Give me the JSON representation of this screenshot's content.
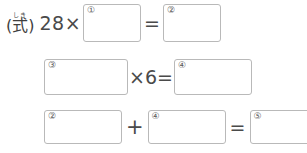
{
  "page": {
    "language": "ja",
    "background_color": "#ffffff",
    "text_color": "#3a3a3a",
    "box_border_color": "#b9b9b9"
  },
  "label": {
    "furigana": "しき",
    "text": "(式)"
  },
  "rows": [
    {
      "id": "row-1",
      "tokens": [
        {
          "kind": "label",
          "value": "(式)"
        },
        {
          "kind": "expr",
          "value": "28×"
        },
        {
          "kind": "box",
          "number": "①"
        },
        {
          "kind": "op",
          "value": "="
        },
        {
          "kind": "box",
          "number": "②"
        }
      ]
    },
    {
      "id": "row-2",
      "tokens": [
        {
          "kind": "box",
          "number": "③"
        },
        {
          "kind": "op",
          "value": "×6="
        },
        {
          "kind": "box",
          "number": "④"
        }
      ]
    },
    {
      "id": "row-3",
      "tokens": [
        {
          "kind": "box",
          "number": "②"
        },
        {
          "kind": "op",
          "value": "+"
        },
        {
          "kind": "box",
          "number": "④"
        },
        {
          "kind": "op",
          "value": "="
        },
        {
          "kind": "box",
          "number": "⑤"
        }
      ]
    }
  ],
  "row1": {
    "multiplicand": "28×",
    "equals": "=",
    "box1_number": "①",
    "box2_number": "②"
  },
  "row2": {
    "box3_number": "③",
    "operator": "×6=",
    "box4_number": "④"
  },
  "row3": {
    "box2_number": "②",
    "plus": "+",
    "box4_number": "④",
    "equals": "=",
    "box5_number": "⑤"
  }
}
